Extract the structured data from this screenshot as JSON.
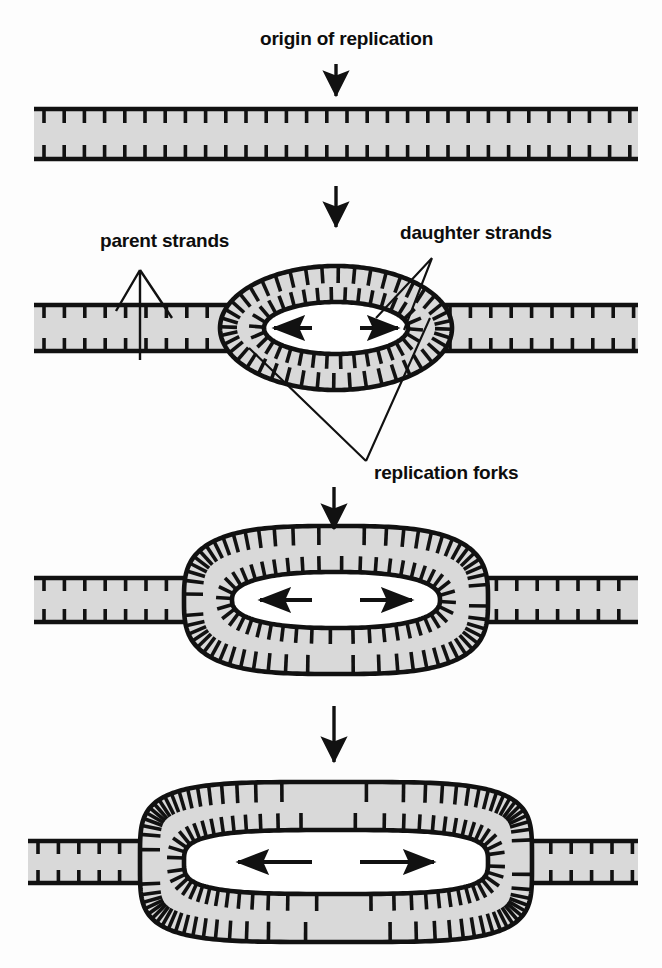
{
  "figure": {
    "title": "origin of replication",
    "background_color": "#fdfdfd",
    "strand_fill_color": "#d9d9d9",
    "stroke_color": "#111111"
  },
  "labels": {
    "origin": "origin of replication",
    "parent": "parent strands",
    "daughter": "daughter strands",
    "forks": "replication forks"
  },
  "stages": [
    {
      "id": "stage-1",
      "name": "unreplicated-duplex",
      "bubble": "none",
      "arrows_inside": 0,
      "y_center": 134
    },
    {
      "id": "stage-2",
      "name": "small-replication-bubble",
      "bubble": "ellipse",
      "arrows_inside": 2,
      "y_center": 328
    },
    {
      "id": "stage-3",
      "name": "medium-replication-bubble",
      "bubble": "rounded-rect",
      "arrows_inside": 2,
      "y_center": 600
    },
    {
      "id": "stage-4",
      "name": "large-replication-bubble",
      "bubble": "rounded-rect",
      "arrows_inside": 2,
      "y_center": 862
    }
  ],
  "flow_arrows": [
    {
      "id": "flow-arrow-1",
      "from": "origin-label",
      "to": "stage-1",
      "direction": "down"
    },
    {
      "id": "flow-arrow-2",
      "from": "stage-1",
      "to": "stage-2",
      "direction": "down"
    },
    {
      "id": "flow-arrow-3",
      "from": "stage-2",
      "to": "stage-3",
      "direction": "down"
    },
    {
      "id": "flow-arrow-4",
      "from": "stage-3",
      "to": "stage-4",
      "direction": "down"
    }
  ],
  "chart_data": {
    "type": "diagram",
    "title": "origin of replication",
    "annotations": [
      "origin of replication",
      "parent strands",
      "daughter strands",
      "replication forks"
    ],
    "series": [
      {
        "name": "bubble_width_px",
        "categories": [
          "stage 1",
          "stage 2",
          "stage 3",
          "stage 4"
        ],
        "values": [
          0,
          210,
          300,
          390
        ]
      }
    ]
  }
}
